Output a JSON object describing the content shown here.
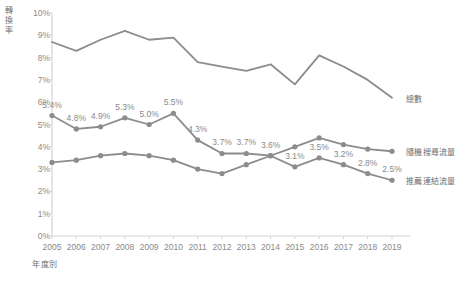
{
  "chart_data": {
    "type": "line",
    "title": "",
    "xlabel": "年度別",
    "ylabel": "轉換率",
    "ylim": [
      0,
      10
    ],
    "ytick_labels": [
      "0%",
      "1%",
      "2%",
      "3%",
      "4%",
      "5%",
      "6%",
      "7%",
      "8%",
      "9%",
      "10%"
    ],
    "ytick_values": [
      0,
      1,
      2,
      3,
      4,
      5,
      6,
      7,
      8,
      9,
      10
    ],
    "grid": false,
    "legend_position": "inline-right",
    "categories": [
      "2005",
      "2006",
      "2007",
      "2008",
      "2009",
      "2010",
      "2011",
      "2012",
      "2013",
      "2014",
      "2015",
      "2016",
      "2017",
      "2018",
      "2019"
    ],
    "series": [
      {
        "name": "總數",
        "color": "#8c8c8c",
        "markers": false,
        "labels_shown": false,
        "values": [
          8.7,
          8.3,
          8.8,
          9.2,
          8.8,
          8.9,
          7.8,
          7.6,
          7.4,
          7.7,
          6.8,
          8.1,
          7.6,
          7.0,
          6.2
        ]
      },
      {
        "name": "隨機搜尋流量",
        "color": "#8c8c8c",
        "markers": true,
        "labels_shown": false,
        "values": [
          3.3,
          3.4,
          3.6,
          3.7,
          3.6,
          3.4,
          3.0,
          2.8,
          3.2,
          3.6,
          4.0,
          4.4,
          4.1,
          3.9,
          3.8
        ]
      },
      {
        "name": "推薦連結流量",
        "color": "#8c8c8c",
        "markers": true,
        "labels_shown": true,
        "values": [
          5.4,
          4.8,
          4.9,
          5.3,
          5.0,
          5.5,
          4.3,
          3.7,
          3.7,
          3.6,
          3.1,
          3.5,
          3.2,
          2.8,
          2.5
        ],
        "labels": [
          "5.4%",
          "4.8%",
          "4.9%",
          "5.3%",
          "5.0%",
          "5.5%",
          "4.3%",
          "3.7%",
          "3.7%",
          "3.6%",
          "3.1%",
          "3.5%",
          "3.2%",
          "2.8%",
          "2.5%"
        ]
      }
    ]
  },
  "legend": {
    "entries": [
      {
        "label": "總數"
      },
      {
        "label": "隨機搜尋流量"
      },
      {
        "label": "推薦連結流量"
      }
    ]
  },
  "axes": {
    "y_title": "轉換率",
    "x_title": "年度別"
  },
  "colors": {
    "line": "#8c8c8c",
    "axis": "#d4d4d4",
    "tick_text": "#8a8a8a",
    "title_text": "#6e6e6e"
  }
}
